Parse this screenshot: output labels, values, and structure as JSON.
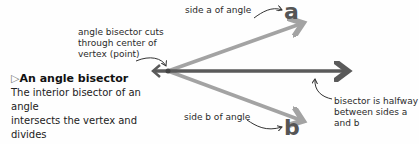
{
  "labels": {
    "side_a": "side a of angle",
    "side_b": "side b of angle",
    "letter_a": "a",
    "letter_b": "b",
    "vertex_note": [
      "angle bisector cuts",
      "through center of",
      "vertex (point)"
    ],
    "bisector_note": [
      "bisector is halfway",
      "between sides a",
      "and b"
    ]
  },
  "caption": {
    "marker": "▷",
    "title": "An angle bisector",
    "text": [
      "The interior bisector of an angle",
      "intersects the vertex and divides",
      "the angle into two equal parts."
    ]
  },
  "colors": {
    "side": "#a3a3a3",
    "bisector": "#5a5a5a",
    "text": "#222222"
  }
}
